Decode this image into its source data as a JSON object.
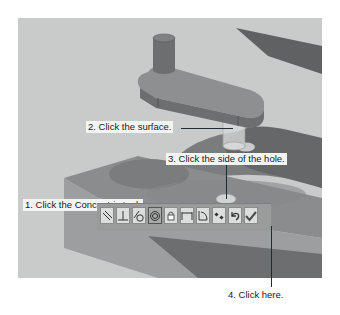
{
  "callouts": {
    "step1": "1. Click the Concentric tool.",
    "step2": "2. Click the surface.",
    "step3": "3. Click the side of the hole.",
    "step4": "4. Click here."
  },
  "toolbar": {
    "tools": [
      {
        "name": "parallel",
        "icon": "parallel-icon"
      },
      {
        "name": "perpendicular",
        "icon": "perpendicular-icon"
      },
      {
        "name": "tangent",
        "icon": "tangent-icon"
      },
      {
        "name": "concentric",
        "icon": "concentric-icon",
        "active": true
      },
      {
        "name": "lock",
        "icon": "lock-icon"
      },
      {
        "name": "distance",
        "icon": "distance-icon"
      },
      {
        "name": "angle",
        "icon": "angle-icon"
      },
      {
        "name": "flip-alignment",
        "icon": "flip-alignment-icon"
      },
      {
        "name": "undo",
        "icon": "undo-icon"
      },
      {
        "name": "ok",
        "icon": "checkmark-icon"
      }
    ]
  },
  "colors": {
    "background": "#c9cbcb",
    "part_dark": "#6f7172",
    "part_mid": "#8d8f90",
    "block_top": "#7e8081",
    "shadow": "#626465",
    "leader": "#1f2a3a"
  }
}
